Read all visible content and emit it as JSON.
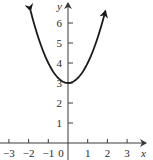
{
  "chart_data": {
    "type": "line",
    "title": "",
    "function": "y = x^2 + 3",
    "xlabel": "x",
    "ylabel": "y",
    "xlim": [
      -3.5,
      3.9
    ],
    "ylim": [
      -0.6,
      7.2
    ],
    "x_ticks": [
      -3,
      -2,
      -1,
      0,
      1,
      2,
      3
    ],
    "x_tick_labels": [
      "−3",
      "−2",
      "−1",
      "0",
      "1",
      "2",
      "3"
    ],
    "y_ticks": [
      1,
      2,
      3,
      4,
      5,
      6
    ],
    "y_tick_labels": [
      "1",
      "2",
      "3",
      "4",
      "5",
      "6"
    ],
    "grid": false,
    "legend": null,
    "series": [
      {
        "name": "parabola",
        "x": [
          -1.9,
          -1.5,
          -1,
          -0.5,
          0,
          0.5,
          1,
          1.5,
          1.9
        ],
        "y": [
          6.61,
          5.25,
          4,
          3.25,
          3,
          3.25,
          4,
          5.25,
          6.61
        ],
        "arrows_at_ends": true
      }
    ],
    "vertex": [
      0,
      3
    ],
    "colors": {
      "curve": "#1a1a1a",
      "axes": "#3a3a3a"
    }
  }
}
